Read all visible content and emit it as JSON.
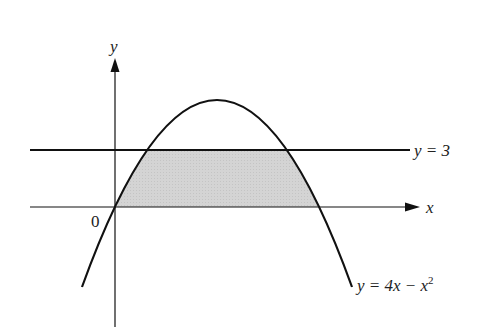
{
  "figure": {
    "type": "region-between-curves",
    "colors": {
      "stroke": "#111111",
      "shade": "#d2d2d2",
      "background": "#ffffff"
    },
    "axes": {
      "x_label": "x",
      "y_label": "y",
      "origin_label": "0"
    },
    "curves": [
      {
        "id": "parabola",
        "label": "y = 4x − x",
        "label_exp": "2",
        "equation": "y = 4x - x^2"
      },
      {
        "id": "horizontal-line",
        "label": "y = 3",
        "equation": "y = 3"
      }
    ],
    "shaded_region": {
      "description": "Region bounded by y = 4x − x², y = 3, and the x-axis (y = 0)"
    }
  }
}
